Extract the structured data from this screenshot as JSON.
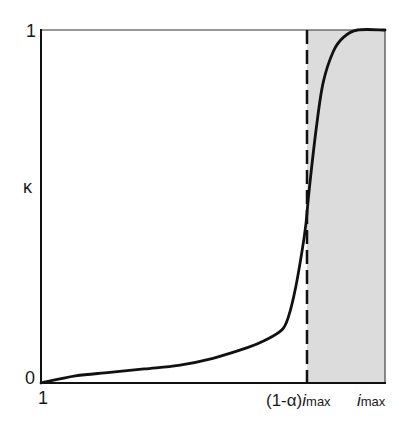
{
  "chart_data": {
    "type": "line",
    "title": "",
    "xlabel": "",
    "ylabel": "κ",
    "ylim": [
      0,
      1
    ],
    "xlim": [
      "1",
      "i_max"
    ],
    "grid": false,
    "legend": null,
    "y_ticks": [
      "0",
      "1"
    ],
    "x_ticks": [
      "1",
      "(1-α)i_max",
      "i_max"
    ],
    "series": [
      {
        "name": "κ",
        "x_fraction": [
          0.0,
          0.1,
          0.2,
          0.3,
          0.4,
          0.5,
          0.6,
          0.65,
          0.7,
          0.72,
          0.74,
          0.76,
          0.77,
          0.78,
          0.8,
          0.82,
          0.85,
          0.88,
          0.92,
          1.0
        ],
        "values": [
          0.0,
          0.02,
          0.03,
          0.04,
          0.05,
          0.07,
          0.1,
          0.12,
          0.15,
          0.19,
          0.27,
          0.38,
          0.45,
          0.55,
          0.72,
          0.85,
          0.94,
          0.98,
          1.0,
          1.0
        ]
      }
    ],
    "annotations": [
      {
        "type": "vline",
        "style": "dashed",
        "x_label": "(1-α)i_max",
        "x_fraction": 0.775
      },
      {
        "type": "shaded_region",
        "from": "(1-α)i_max",
        "to": "i_max",
        "color": "#dcdcdc"
      }
    ]
  },
  "labels": {
    "y_top": "1",
    "y_bottom": "0",
    "y_axis": "κ",
    "x_start": "1",
    "x_mid_prefix": "(1-α)",
    "x_mid_var": "i",
    "x_mid_sub": "max",
    "x_end_var": "i",
    "x_end_sub": "max"
  },
  "colors": {
    "curve": "#111111",
    "axis": "#222222",
    "shade": "#dcdcdc"
  }
}
